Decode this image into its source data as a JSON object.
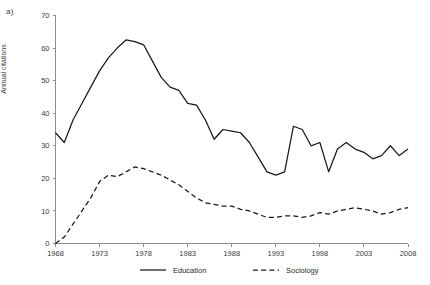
{
  "figure": {
    "panel_label": "a)",
    "background_color": "#ffffff",
    "ink_color": "#1a1a1a",
    "axis_color": "#8d8d8d"
  },
  "chart_data": {
    "type": "line",
    "title": "",
    "subtitle": "",
    "xlabel": "",
    "ylabel": "Annual citations",
    "xlim": [
      1968,
      2008
    ],
    "ylim": [
      0,
      70
    ],
    "ytick_step": 10,
    "xtick_step": 5,
    "grid": false,
    "legend_position": "bottom",
    "ytick_labels": [
      "0",
      "10",
      "20",
      "30",
      "40",
      "50",
      "60",
      "70"
    ],
    "ytick_values": [
      0,
      10,
      20,
      30,
      40,
      50,
      60,
      70
    ],
    "xtick_labels": [
      "1968",
      "1973",
      "1978",
      "1983",
      "1988",
      "1993",
      "1998",
      "2003",
      "2008"
    ],
    "xtick_values": [
      1968,
      1973,
      1978,
      1983,
      1988,
      1993,
      1998,
      2003,
      2008
    ],
    "x": [
      1968,
      1969,
      1970,
      1971,
      1972,
      1973,
      1974,
      1975,
      1976,
      1977,
      1978,
      1979,
      1980,
      1981,
      1982,
      1983,
      1984,
      1985,
      1986,
      1987,
      1988,
      1989,
      1990,
      1991,
      1992,
      1993,
      1994,
      1995,
      1996,
      1997,
      1998,
      1999,
      2000,
      2001,
      2002,
      2003,
      2004,
      2005,
      2006,
      2007,
      2008
    ],
    "series": [
      {
        "name": "Education",
        "style": "solid",
        "color": "#1a1a1a",
        "values": [
          34,
          31,
          38,
          43,
          48,
          53,
          57,
          60,
          62.5,
          62,
          61,
          56,
          51,
          48,
          47,
          43,
          42.5,
          38,
          32,
          35,
          34.5,
          34,
          31,
          26.5,
          22,
          21,
          22,
          36,
          35,
          30,
          31,
          22,
          29,
          31,
          29,
          28,
          26,
          27,
          30,
          27,
          29
        ]
      },
      {
        "name": "Sociology",
        "style": "dashed",
        "color": "#1a1a1a",
        "values": [
          0,
          2,
          6,
          10,
          14,
          19,
          21,
          20.5,
          22,
          23.5,
          23,
          22,
          21,
          19.5,
          18,
          16,
          14,
          12.5,
          12,
          11.5,
          11.5,
          10.5,
          10,
          9,
          8,
          8,
          8.5,
          8.5,
          8,
          8.5,
          9.5,
          9,
          10,
          10.5,
          11,
          10.5,
          10,
          9,
          9.5,
          10.5,
          11
        ]
      }
    ],
    "legend": [
      {
        "label": "Education",
        "style": "solid"
      },
      {
        "label": "Sociology",
        "style": "dashed"
      }
    ]
  }
}
